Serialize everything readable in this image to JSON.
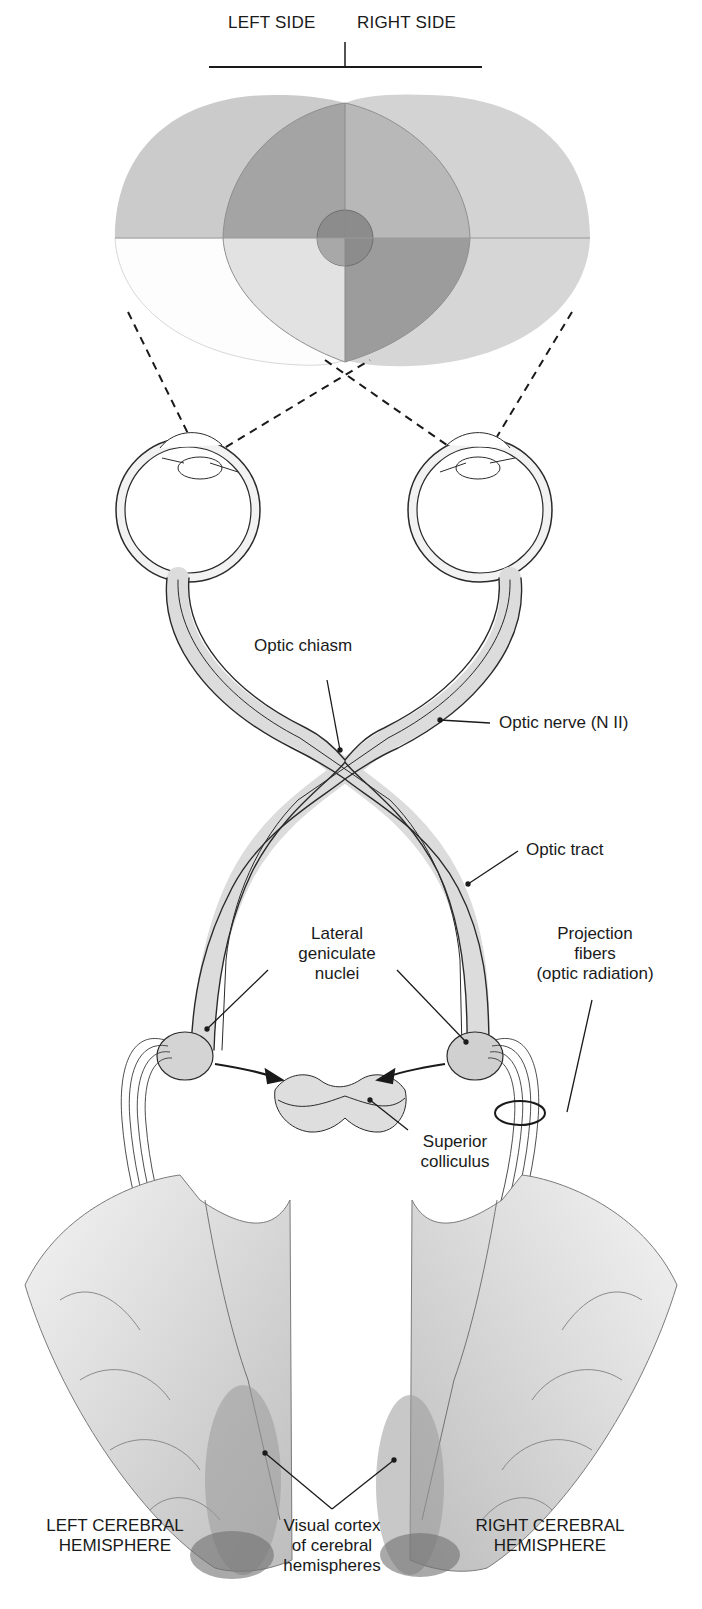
{
  "header": {
    "left_side": "LEFT SIDE",
    "right_side": "RIGHT SIDE"
  },
  "labels": {
    "optic_chiasm": "Optic chiasm",
    "optic_nerve": "Optic nerve (N II)",
    "optic_tract": "Optic tract",
    "lateral_geniculate": [
      "Lateral",
      "geniculate",
      "nuclei"
    ],
    "projection_fibers": [
      "Projection",
      "fibers",
      "(optic radiation)"
    ],
    "superior_colliculus": [
      "Superior",
      "colliculus"
    ],
    "visual_cortex": [
      "Visual cortex",
      "of cerebral",
      "hemispheres"
    ],
    "left_hemisphere": [
      "LEFT CEREBRAL",
      "HEMISPHERE"
    ],
    "right_hemisphere": [
      "RIGHT CEREBRAL",
      "HEMISPHERE"
    ]
  },
  "colors": {
    "line": "#1a1a1a",
    "field_light": "#d4d4d4",
    "field_mid": "#a9a9a9",
    "field_dark": "#8a8a8a",
    "tissue": "#e6e6e6",
    "tissue_shade": "#c8c8c8"
  }
}
